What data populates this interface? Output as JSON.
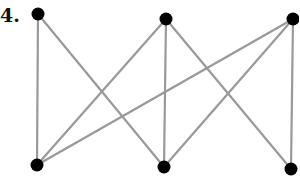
{
  "problem_label": "4.",
  "graph": {
    "edge_color": "#999999",
    "node_color": "#000000",
    "nodes": [
      {
        "id": "top-left",
        "x": 38,
        "y": 14
      },
      {
        "id": "top-middle",
        "x": 166,
        "y": 19
      },
      {
        "id": "top-right",
        "x": 293,
        "y": 19
      },
      {
        "id": "bottom-left",
        "x": 37,
        "y": 165
      },
      {
        "id": "bottom-middle",
        "x": 164,
        "y": 167
      },
      {
        "id": "bottom-right",
        "x": 291,
        "y": 169
      }
    ],
    "edges": [
      [
        "top-left",
        "bottom-left"
      ],
      [
        "top-left",
        "bottom-middle"
      ],
      [
        "top-middle",
        "bottom-left"
      ],
      [
        "top-middle",
        "bottom-middle"
      ],
      [
        "top-middle",
        "bottom-right"
      ],
      [
        "top-right",
        "bottom-left"
      ],
      [
        "top-right",
        "bottom-middle"
      ],
      [
        "top-right",
        "bottom-right"
      ]
    ]
  }
}
